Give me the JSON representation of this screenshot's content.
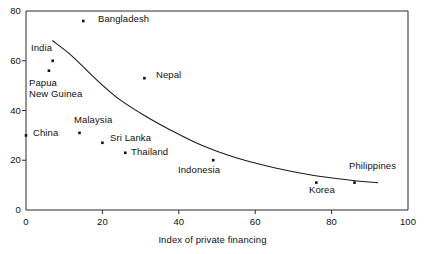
{
  "chart_data": {
    "type": "scatter",
    "title": "",
    "xlabel": "Index of private financing",
    "ylabel": "",
    "xlim": [
      0,
      100
    ],
    "ylim": [
      0,
      80
    ],
    "xticks": [
      "0",
      "20",
      "40",
      "60",
      "80",
      "100"
    ],
    "xtick_values": [
      0,
      20,
      40,
      60,
      80,
      100
    ],
    "yticks": [
      "0",
      "20",
      "40",
      "60",
      "80"
    ],
    "ytick_values": [
      0,
      20,
      40,
      60,
      80
    ],
    "grid": false,
    "legend": "none",
    "points": [
      {
        "name": "Bangladesh",
        "x": 15,
        "y": 76
      },
      {
        "name": "India",
        "x": 7,
        "y": 60
      },
      {
        "name": "Papua New Guinea",
        "x": 6,
        "y": 56
      },
      {
        "name": "Nepal",
        "x": 31,
        "y": 53
      },
      {
        "name": "Malaysia",
        "x": 14,
        "y": 31
      },
      {
        "name": "China",
        "x": 0,
        "y": 30
      },
      {
        "name": "Sri Lanka",
        "x": 20,
        "y": 27
      },
      {
        "name": "Thailand",
        "x": 26,
        "y": 23
      },
      {
        "name": "Indonesia",
        "x": 49,
        "y": 20
      },
      {
        "name": "Korea",
        "x": 76,
        "y": 11
      },
      {
        "name": "Philippines",
        "x": 86,
        "y": 11
      }
    ],
    "trend_curve": {
      "description": "fitted declining curve",
      "points": [
        {
          "x": 7,
          "y": 68
        },
        {
          "x": 12,
          "y": 62
        },
        {
          "x": 18,
          "y": 53
        },
        {
          "x": 24,
          "y": 45
        },
        {
          "x": 31,
          "y": 38
        },
        {
          "x": 38,
          "y": 32
        },
        {
          "x": 46,
          "y": 26
        },
        {
          "x": 55,
          "y": 21
        },
        {
          "x": 65,
          "y": 17
        },
        {
          "x": 75,
          "y": 14
        },
        {
          "x": 85,
          "y": 12
        },
        {
          "x": 92,
          "y": 11
        }
      ]
    },
    "labels_placement": [
      {
        "name": "Bangladesh",
        "text": "Bangladesh",
        "px": 98,
        "py": 14
      },
      {
        "name": "India",
        "text": "India",
        "px": 31,
        "py": 43
      },
      {
        "name": "Papua New Guinea",
        "text": "Papua",
        "text2": "New Guinea",
        "px": 29,
        "py": 78
      },
      {
        "name": "Nepal",
        "text": "Nepal",
        "px": 156,
        "py": 70
      },
      {
        "name": "Malaysia",
        "text": "Malaysia",
        "px": 74,
        "py": 115
      },
      {
        "name": "China",
        "text": "China",
        "px": 33,
        "py": 128
      },
      {
        "name": "Sri Lanka",
        "text": "Sri Lanka",
        "px": 110,
        "py": 133
      },
      {
        "name": "Thailand",
        "text": "Thailand",
        "px": 131,
        "py": 147
      },
      {
        "name": "Indonesia",
        "text": "Indonesia",
        "px": 178,
        "py": 165
      },
      {
        "name": "Korea",
        "text": "Korea",
        "px": 309,
        "py": 185
      },
      {
        "name": "Philippines",
        "text": "Philippines",
        "px": 349,
        "py": 161
      }
    ]
  }
}
